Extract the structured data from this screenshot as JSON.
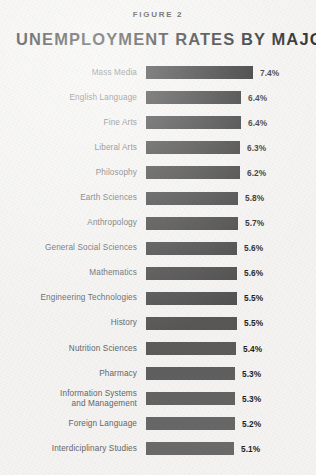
{
  "figure_label": "FIGURE 2",
  "title": "UNEMPLOYMENT RATES BY MAJOR",
  "background_color": "#f4f3f1",
  "label_color": "#63666a",
  "value_color": "#1f1f1f",
  "chart_data": {
    "type": "bar",
    "orientation": "horizontal",
    "title": "UNEMPLOYMENT RATES BY MAJOR",
    "subtitle": "FIGURE 2",
    "xlabel": "",
    "ylabel": "",
    "grid": false,
    "legend": "none",
    "axis_visible": false,
    "value_suffix": "%",
    "note": "Bar lengths use a truncated (non-zero-based) scale; darkest bar is the highest rate.",
    "categories": [
      "Mass Media",
      "English Language",
      "Fine Arts",
      "Liberal Arts",
      "Philosophy",
      "Earth Sciences",
      "Anthropology",
      "General Social Sciences",
      "Mathematics",
      "Engineering Technologies",
      "History",
      "Nutrition Sciences",
      "Pharmacy",
      "Information Systems and Management",
      "Foreign Language",
      "Interdiciplinary Studies"
    ],
    "values": [
      7.4,
      6.4,
      6.4,
      6.3,
      6.2,
      5.8,
      5.7,
      5.6,
      5.6,
      5.5,
      5.5,
      5.4,
      5.3,
      5.3,
      5.2,
      5.1
    ],
    "value_labels": [
      "7.4%",
      "6.4%",
      "6.4%",
      "6.3%",
      "6.2%",
      "5.8%",
      "5.7%",
      "5.6%",
      "5.6%",
      "5.5%",
      "5.5%",
      "5.4%",
      "5.3%",
      "5.3%",
      "5.2%",
      "5.1%"
    ]
  },
  "rows": [
    {
      "label_line1": "Mass Media",
      "label_line2": "",
      "value": "7.4%",
      "bar_px": 107,
      "color": "#1d1d1d"
    },
    {
      "label_line1": "English Language",
      "label_line2": "",
      "value": "6.4%",
      "bar_px": 95,
      "color": "#262626"
    },
    {
      "label_line1": "Fine Arts",
      "label_line2": "",
      "value": "6.4%",
      "bar_px": 95,
      "color": "#2c2c2c"
    },
    {
      "label_line1": "Liberal Arts",
      "label_line2": "",
      "value": "6.3%",
      "bar_px": 94,
      "color": "#323232"
    },
    {
      "label_line1": "Philosophy",
      "label_line2": "",
      "value": "6.2%",
      "bar_px": 94,
      "color": "#383838"
    },
    {
      "label_line1": "Earth Sciences",
      "label_line2": "",
      "value": "5.8%",
      "bar_px": 92,
      "color": "#3e3e3e"
    },
    {
      "label_line1": "Anthropology",
      "label_line2": "",
      "value": "5.7%",
      "bar_px": 92,
      "color": "#434343"
    },
    {
      "label_line1": "General Social Sciences",
      "label_line2": "",
      "value": "5.6%",
      "bar_px": 91,
      "color": "#484848"
    },
    {
      "label_line1": "Mathematics",
      "label_line2": "",
      "value": "5.6%",
      "bar_px": 91,
      "color": "#4d4d4d"
    },
    {
      "label_line1": "Engineering Technologies",
      "label_line2": "",
      "value": "5.5%",
      "bar_px": 91,
      "color": "#525252"
    },
    {
      "label_line1": "History",
      "label_line2": "",
      "value": "5.5%",
      "bar_px": 91,
      "color": "#575757"
    },
    {
      "label_line1": "Nutrition Sciences",
      "label_line2": "",
      "value": "5.4%",
      "bar_px": 90,
      "color": "#5b5b5b"
    },
    {
      "label_line1": "Pharmacy",
      "label_line2": "",
      "value": "5.3%",
      "bar_px": 89,
      "color": "#5f5f5f"
    },
    {
      "label_line1": "Information Systems",
      "label_line2": "and Management",
      "value": "5.3%",
      "bar_px": 89,
      "color": "#636363"
    },
    {
      "label_line1": "Foreign Language",
      "label_line2": "",
      "value": "5.2%",
      "bar_px": 89,
      "color": "#676767"
    },
    {
      "label_line1": "Interdiciplinary Studies",
      "label_line2": "",
      "value": "5.1%",
      "bar_px": 88,
      "color": "#6a6a6a"
    }
  ]
}
